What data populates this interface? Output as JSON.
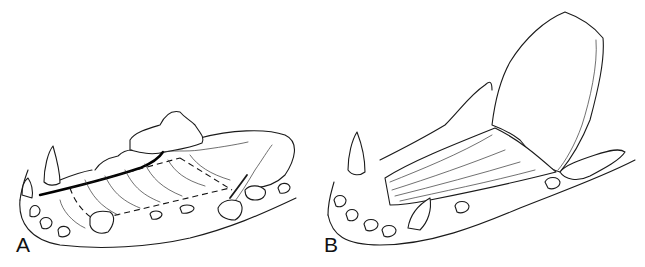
{
  "figure": {
    "panels": [
      {
        "label": "A",
        "description": "Mandible (lower jaw) line drawing with dashed incision outline along the gingiva and a dark vessel line"
      },
      {
        "label": "B",
        "description": "Mandible line drawing with mucosal flap elevated and reflected upward exposing underlying tissue"
      }
    ]
  }
}
